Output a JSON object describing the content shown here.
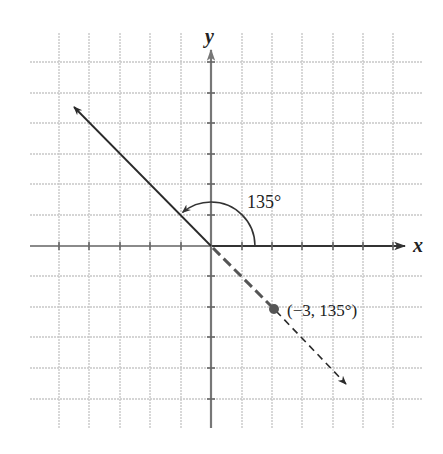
{
  "diagram": {
    "type": "polar-point-plot",
    "axes": {
      "x_label": "x",
      "y_label": "y"
    },
    "grid": {
      "spacing_px": 30.3,
      "origin_px": [
        211,
        246
      ],
      "x_lines_px": [
        59,
        89,
        120,
        150,
        181,
        242,
        272,
        302,
        333,
        363,
        393
      ],
      "y_lines_px": [
        62,
        93,
        123,
        154,
        184,
        215,
        276,
        307,
        337,
        368,
        399
      ],
      "extent_px": {
        "left": 30,
        "right": 423,
        "top": 33,
        "bottom": 428
      }
    },
    "terminal_ray": {
      "angle_label": "135°",
      "angle_degrees": 135,
      "style": "solid"
    },
    "opposite_ray": {
      "style": "dashed"
    },
    "point": {
      "label": "(−3, 135°)",
      "r": -3,
      "theta_degrees": 135
    },
    "colors": {
      "grid": "#c8c8c8",
      "axis_left": "#8a8a8a",
      "axis_right": "#333333",
      "ray": "#2a2a2a",
      "point": "#555555",
      "text": "#222222"
    }
  }
}
